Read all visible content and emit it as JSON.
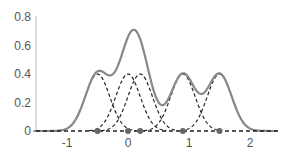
{
  "chart_data": {
    "type": "line",
    "title": "",
    "xlabel": "",
    "ylabel": "",
    "xlim": [
      -1.6,
      2.4
    ],
    "ylim": [
      0,
      0.8
    ],
    "grid": false,
    "legend": null,
    "xticks": [
      -1,
      0,
      1,
      2
    ],
    "yticks": [
      0,
      0.2,
      0.4,
      0.6,
      0.8
    ],
    "xtick_labels": [
      "-1",
      "0",
      "1",
      "2"
    ],
    "ytick_labels": [
      "0",
      "0.2",
      "0.4",
      "0.6",
      "0.8"
    ],
    "sample_points": [
      -0.5,
      0.0,
      0.2,
      0.9,
      1.5
    ],
    "kernel_sigma": 0.2,
    "kernel_peak": 0.4,
    "series": [
      {
        "name": "kde",
        "style": "solid",
        "color": "#888888"
      },
      {
        "name": "kernels",
        "style": "dashed",
        "color": "#222222"
      },
      {
        "name": "samples",
        "style": "markers",
        "color": "#666666"
      }
    ]
  }
}
